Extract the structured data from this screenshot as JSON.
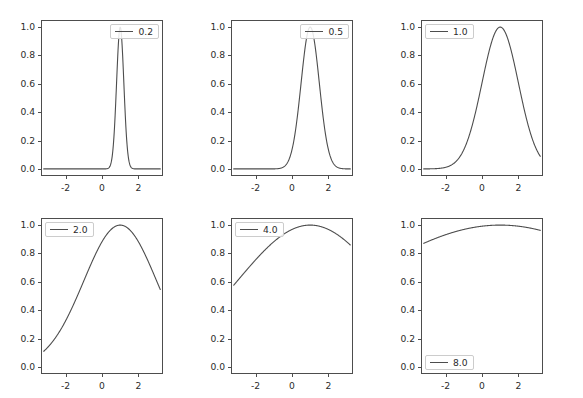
{
  "figure": {
    "width": 583,
    "height": 398,
    "background": "#ffffff",
    "line_color": "#4d4d4d",
    "axis_color": "#4d4d4d",
    "text_color": "#2b2b2b",
    "rows": 2,
    "cols": 3
  },
  "axis": {
    "xticks": [
      "-2",
      "0",
      "2"
    ],
    "xtick_values": [
      -2,
      0,
      2
    ],
    "yticks": [
      "0.0",
      "0.2",
      "0.4",
      "0.6",
      "0.8",
      "1.0"
    ],
    "ytick_values": [
      0.0,
      0.2,
      0.4,
      0.6,
      0.8,
      1.0
    ],
    "xlim": [
      -3.35,
      3.35
    ],
    "ylim": [
      -0.05,
      1.05
    ]
  },
  "chart_data": {
    "type": "line",
    "title": "",
    "xlabel": "",
    "ylabel": "",
    "xlim": [
      -3.35,
      3.35
    ],
    "ylim": [
      -0.05,
      1.05
    ],
    "grid": false,
    "legend_position_default": "upper right",
    "subplot_grid": [
      2,
      3
    ],
    "formula": "y = exp(-(x - 1)^2 / (2 * sigma^2))",
    "center": 1.0,
    "x_range": [
      -3.2,
      3.2
    ],
    "panels": [
      {
        "index": 0,
        "row": 0,
        "col": 0,
        "legend_label": "0.2",
        "sigma": 0.2,
        "legend_position": "upper right",
        "left": 41,
        "top": 20,
        "width": 122,
        "height": 156,
        "x": [
          -3.2,
          -2.8,
          -2.4,
          -2.0,
          -1.6,
          -1.2,
          -0.8,
          -0.4,
          0.0,
          0.2,
          0.4,
          0.5,
          0.6,
          0.7,
          0.8,
          0.9,
          1.0,
          1.1,
          1.2,
          1.3,
          1.4,
          1.5,
          1.6,
          1.8,
          2.0,
          2.4,
          2.8,
          3.2
        ],
        "y": [
          0.0,
          0.0,
          0.0,
          0.0,
          0.0,
          0.0,
          0.0,
          0.0,
          0.0,
          0.002,
          0.044,
          0.131,
          0.325,
          0.641,
          0.882,
          0.969,
          1.0,
          0.969,
          0.882,
          0.641,
          0.325,
          0.131,
          0.044,
          0.002,
          0.0,
          0.0,
          0.0,
          0.0
        ]
      },
      {
        "index": 1,
        "row": 0,
        "col": 1,
        "legend_label": "0.5",
        "sigma": 0.5,
        "legend_position": "upper right",
        "left": 231,
        "top": 20,
        "width": 122,
        "height": 156,
        "x": [
          -3.2,
          -2.8,
          -2.4,
          -2.0,
          -1.6,
          -1.2,
          -0.8,
          -0.4,
          0.0,
          0.25,
          0.5,
          0.75,
          1.0,
          1.25,
          1.5,
          1.75,
          2.0,
          2.4,
          2.8,
          3.2
        ],
        "y": [
          0.0,
          0.0,
          0.0,
          0.0,
          0.0,
          0.002,
          0.011,
          0.048,
          0.135,
          0.324,
          0.607,
          0.882,
          1.0,
          0.882,
          0.607,
          0.324,
          0.135,
          0.011,
          0.0,
          0.0
        ]
      },
      {
        "index": 2,
        "row": 0,
        "col": 2,
        "legend_label": "1.0",
        "sigma": 1.0,
        "legend_position": "upper left",
        "left": 421,
        "top": 20,
        "width": 122,
        "height": 156,
        "x": [
          -3.2,
          -2.8,
          -2.4,
          -2.0,
          -1.6,
          -1.2,
          -0.8,
          -0.4,
          0.0,
          0.4,
          0.8,
          1.0,
          1.2,
          1.6,
          2.0,
          2.4,
          2.8,
          3.2
        ],
        "y": [
          0.0003,
          0.0013,
          0.0048,
          0.011,
          0.032,
          0.085,
          0.198,
          0.375,
          0.607,
          0.835,
          0.98,
          1.0,
          0.98,
          0.835,
          0.607,
          0.375,
          0.198,
          0.141
        ]
      },
      {
        "index": 3,
        "row": 1,
        "col": 0,
        "legend_label": "2.0",
        "sigma": 2.0,
        "legend_position": "upper left",
        "left": 41,
        "top": 218,
        "width": 122,
        "height": 156,
        "x": [
          -3.2,
          -2.8,
          -2.4,
          -2.0,
          -1.6,
          -1.2,
          -0.8,
          -0.4,
          0.0,
          0.4,
          0.8,
          1.0,
          1.4,
          1.8,
          2.2,
          2.6,
          3.0,
          3.2
        ],
        "y": [
          0.141,
          0.199,
          0.268,
          0.325,
          0.413,
          0.506,
          0.598,
          0.686,
          0.882,
          0.895,
          0.995,
          1.0,
          0.98,
          0.92,
          0.829,
          0.72,
          0.607,
          0.605
        ]
      },
      {
        "index": 4,
        "row": 1,
        "col": 1,
        "legend_label": "4.0",
        "sigma": 4.0,
        "legend_position": "upper left",
        "left": 231,
        "top": 218,
        "width": 122,
        "height": 156,
        "x": [
          -3.2,
          -2.8,
          -2.4,
          -2.0,
          -1.6,
          -1.2,
          -0.8,
          -0.4,
          0.0,
          0.4,
          0.8,
          1.0,
          1.4,
          1.8,
          2.2,
          2.6,
          3.0,
          3.2
        ],
        "y": [
          0.607,
          0.654,
          0.699,
          0.754,
          0.794,
          0.835,
          0.876,
          0.912,
          0.969,
          0.989,
          0.999,
          1.0,
          0.995,
          0.98,
          0.956,
          0.925,
          0.882,
          0.867
        ]
      },
      {
        "index": 5,
        "row": 1,
        "col": 2,
        "legend_label": "8.0",
        "sigma": 8.0,
        "legend_position": "lower left",
        "left": 421,
        "top": 218,
        "width": 122,
        "height": 156,
        "x": [
          -3.2,
          -2.8,
          -2.4,
          -2.0,
          -1.6,
          -1.2,
          -0.8,
          -0.4,
          0.0,
          0.4,
          0.8,
          1.0,
          1.4,
          1.8,
          2.2,
          2.6,
          3.0,
          3.2
        ],
        "y": [
          0.882,
          0.9,
          0.918,
          0.932,
          0.946,
          0.958,
          0.969,
          0.978,
          0.992,
          0.997,
          1.0,
          1.0,
          0.999,
          0.996,
          0.989,
          0.98,
          0.969,
          0.966
        ]
      }
    ]
  }
}
